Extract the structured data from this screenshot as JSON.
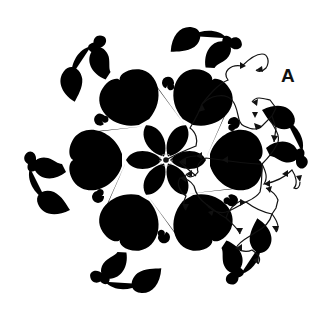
{
  "figure": {
    "type": "quilting-stitch-path-diagram",
    "label": "A",
    "symmetry": 6,
    "center": [
      166,
      160
    ],
    "colors": {
      "motif_dashed": "#b9b9b9",
      "stitch_path": "#111111",
      "background": "#ffffff"
    },
    "elements": {
      "start_point": "filled-dot at center of flower",
      "motif": "dashed outline: central 6-petal flower, hearts with spirals, swan/bird shapes on perimeter",
      "path": "solid line with arrowheads tracing one repeat (right sector)"
    }
  }
}
